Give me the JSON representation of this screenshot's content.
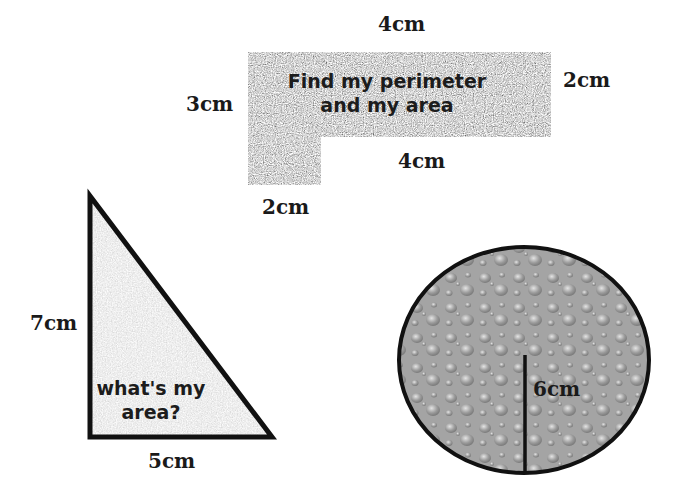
{
  "l_shape": {
    "prompt_line1": "Find my perimeter",
    "prompt_line2": "and my area",
    "labels": {
      "top": "4cm",
      "right": "2cm",
      "left": "3cm",
      "inner_bottom": "4cm",
      "bottom": "2cm"
    },
    "fill_color": "#a8a8a8"
  },
  "triangle": {
    "prompt_line1": "what's my",
    "prompt_line2": "area?",
    "labels": {
      "height": "7cm",
      "base": "5cm"
    },
    "fill_color": "#d6d6d6",
    "stroke_color": "#111111"
  },
  "circle": {
    "labels": {
      "radius": "6cm"
    },
    "fill_color": "#9a9a9a",
    "stroke_color": "#111111"
  }
}
